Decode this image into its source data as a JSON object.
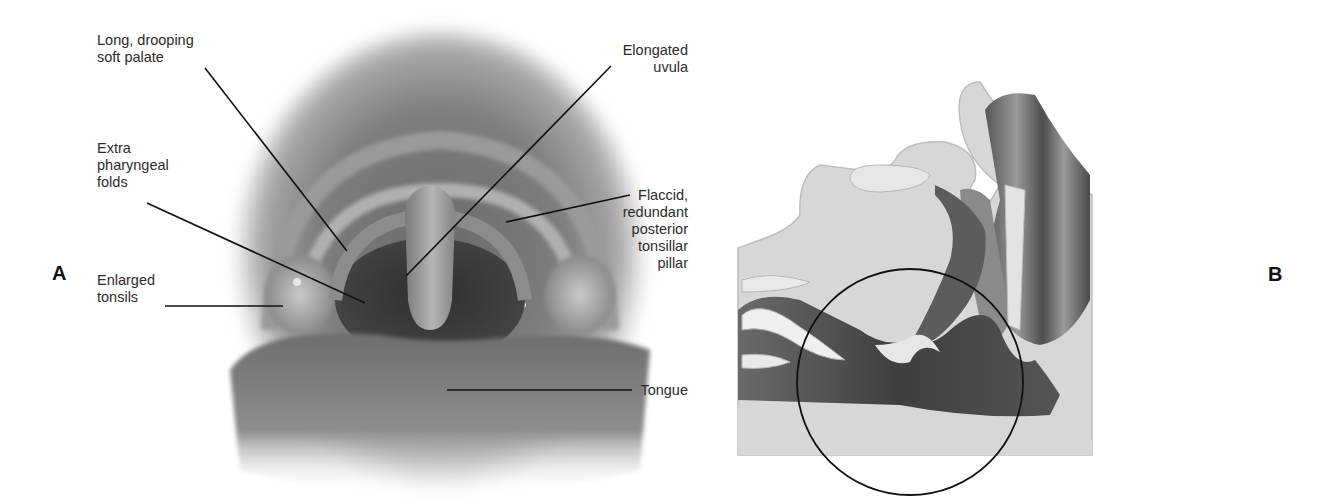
{
  "figure": {
    "panels": [
      {
        "id": "A",
        "letter": "A",
        "view": "oral cavity, frontal view"
      },
      {
        "id": "B",
        "letter": "B",
        "view": "sagittal section of upper airway"
      }
    ]
  },
  "panel_a": {
    "letter": "A",
    "labels": {
      "soft_palate": "Long, drooping\nsoft palate",
      "pharyngeal_folds": "Extra\npharyngeal\nfolds",
      "tonsils": "Enlarged\ntonsils",
      "uvula": "Elongated\nuvula",
      "tonsillar_pillar": "Flaccid,\nredundant\nposterior\ntonsillar\npillar",
      "tongue": "Tongue"
    }
  },
  "panel_b": {
    "letter": "B",
    "annotation": "circle-highlight-obstruction"
  },
  "colors": {
    "background": "#ffffff",
    "text": "#2b2b2b",
    "leader": "#111111",
    "tissue_light": "#d9d9d9",
    "tissue_dark": "#4a4a4a"
  }
}
